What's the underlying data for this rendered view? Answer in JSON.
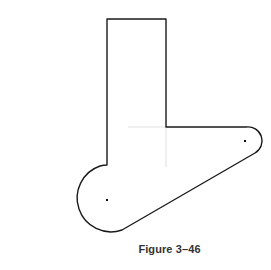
{
  "figure": {
    "caption": "Figure 3–46",
    "stroke_color": "#1a1a1a",
    "centerline_color": "#d8d8d8",
    "center_points": [
      {
        "x": 107,
        "y": 200
      },
      {
        "x": 245,
        "y": 141
      }
    ]
  }
}
